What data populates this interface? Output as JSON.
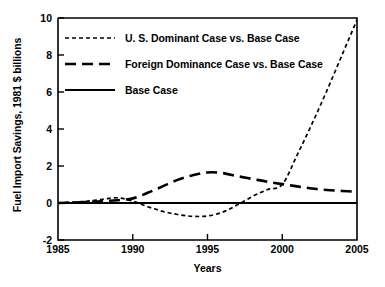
{
  "chart_data": {
    "type": "line",
    "title": "",
    "xlabel": "Years",
    "ylabel": "Fuel Import Savings, 1981 $ billions",
    "xlim": [
      1985,
      2005
    ],
    "ylim": [
      -2,
      10
    ],
    "xticks": [
      1985,
      1990,
      1995,
      2000,
      2005
    ],
    "xticklabels": [
      "1985",
      "1990",
      "1995",
      "2000",
      "2005"
    ],
    "yticks": [
      -2,
      0,
      2,
      4,
      6,
      8,
      10
    ],
    "yticklabels": [
      "-2",
      "0",
      "2",
      "4",
      "6",
      "8",
      "10"
    ],
    "grid": false,
    "legend_position": "upper left inside",
    "series": [
      {
        "name": "U. S. Dominant Case vs. Base Case",
        "style": "short-dashed",
        "color": "#000000",
        "x": [
          1985,
          1986,
          1987,
          1988,
          1989,
          1990,
          1991,
          1992,
          1993,
          1994,
          1995,
          1996,
          1997,
          1998,
          1999,
          2000,
          2001,
          2002,
          2003,
          2004,
          2005
        ],
        "y": [
          0.0,
          0.05,
          0.1,
          0.2,
          0.28,
          0.1,
          -0.2,
          -0.45,
          -0.62,
          -0.72,
          -0.7,
          -0.5,
          -0.1,
          0.35,
          0.72,
          1.0,
          2.6,
          4.3,
          6.1,
          8.0,
          9.9
        ]
      },
      {
        "name": "Foreign Dominance Case vs. Base Case",
        "style": "long-dashed",
        "color": "#000000",
        "x": [
          1985,
          1986,
          1987,
          1988,
          1989,
          1990,
          1991,
          1992,
          1993,
          1994,
          1995,
          1996,
          1997,
          1998,
          1999,
          2000,
          2001,
          2002,
          2003,
          2004,
          2005
        ],
        "y": [
          0.0,
          0.02,
          0.05,
          0.1,
          0.15,
          0.25,
          0.55,
          0.9,
          1.25,
          1.5,
          1.65,
          1.62,
          1.45,
          1.3,
          1.15,
          1.02,
          0.9,
          0.78,
          0.7,
          0.65,
          0.6
        ]
      },
      {
        "name": "Base Case",
        "style": "solid",
        "color": "#000000",
        "x": [
          1985,
          2005
        ],
        "y": [
          0.0,
          0.0
        ]
      }
    ]
  },
  "axes": {
    "ylabel": "Fuel Import Savings, 1981 $ billions",
    "xlabel": "Years"
  },
  "legend": {
    "items": [
      {
        "label": "U. S. Dominant Case vs. Base Case",
        "style": "short-dashed"
      },
      {
        "label": "Foreign Dominance Case vs. Base Case",
        "style": "long-dashed"
      },
      {
        "label": "Base Case",
        "style": "solid"
      }
    ]
  }
}
